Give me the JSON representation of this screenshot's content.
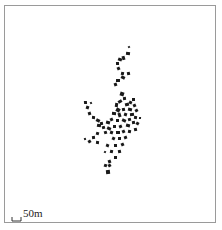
{
  "map": {
    "type": "building footprint map",
    "frame_color": "#9a9a9a",
    "building_color": "#1a1a1a",
    "background_color": "#ffffff"
  },
  "scale_bar": {
    "label": "50m"
  },
  "buildings": [
    [
      128,
      46,
      2,
      2
    ],
    [
      126,
      52,
      4,
      3
    ],
    [
      122,
      56,
      3,
      4
    ],
    [
      118,
      58,
      4,
      3
    ],
    [
      116,
      62,
      3,
      3
    ],
    [
      117,
      67,
      3,
      3
    ],
    [
      121,
      72,
      3,
      3
    ],
    [
      127,
      72,
      3,
      3
    ],
    [
      121,
      76,
      4,
      3
    ],
    [
      116,
      79,
      4,
      3
    ],
    [
      114,
      83,
      3,
      3
    ],
    [
      120,
      92,
      4,
      4
    ],
    [
      123,
      97,
      3,
      3
    ],
    [
      118,
      100,
      4,
      3
    ],
    [
      115,
      103,
      3,
      4
    ],
    [
      125,
      103,
      4,
      3
    ],
    [
      129,
      101,
      3,
      3
    ],
    [
      132,
      98,
      3,
      3
    ],
    [
      133,
      104,
      3,
      3
    ],
    [
      128,
      108,
      4,
      3
    ],
    [
      122,
      108,
      3,
      3
    ],
    [
      116,
      108,
      4,
      4
    ],
    [
      112,
      112,
      4,
      3
    ],
    [
      118,
      113,
      3,
      4
    ],
    [
      124,
      113,
      3,
      3
    ],
    [
      130,
      113,
      4,
      3
    ],
    [
      135,
      109,
      3,
      3
    ],
    [
      134,
      116,
      3,
      3
    ],
    [
      128,
      118,
      3,
      3
    ],
    [
      122,
      119,
      4,
      3
    ],
    [
      116,
      119,
      3,
      3
    ],
    [
      110,
      118,
      3,
      3
    ],
    [
      106,
      121,
      4,
      3
    ],
    [
      100,
      122,
      3,
      3
    ],
    [
      96,
      119,
      4,
      3
    ],
    [
      92,
      116,
      3,
      3
    ],
    [
      88,
      112,
      3,
      3
    ],
    [
      86,
      106,
      3,
      3
    ],
    [
      84,
      101,
      3,
      3
    ],
    [
      90,
      102,
      2,
      2
    ],
    [
      97,
      124,
      4,
      3
    ],
    [
      102,
      126,
      3,
      3
    ],
    [
      107,
      127,
      4,
      3
    ],
    [
      113,
      125,
      3,
      3
    ],
    [
      119,
      125,
      3,
      3
    ],
    [
      126,
      124,
      4,
      3
    ],
    [
      132,
      121,
      3,
      3
    ],
    [
      136,
      122,
      3,
      3
    ],
    [
      139,
      117,
      2,
      2
    ],
    [
      104,
      131,
      3,
      3
    ],
    [
      110,
      131,
      3,
      3
    ],
    [
      116,
      131,
      4,
      3
    ],
    [
      122,
      130,
      3,
      3
    ],
    [
      128,
      130,
      3,
      3
    ],
    [
      134,
      128,
      3,
      3
    ],
    [
      112,
      137,
      3,
      3
    ],
    [
      118,
      137,
      3,
      3
    ],
    [
      124,
      136,
      3,
      3
    ],
    [
      96,
      132,
      3,
      3
    ],
    [
      92,
      136,
      3,
      3
    ],
    [
      88,
      140,
      3,
      3
    ],
    [
      96,
      141,
      3,
      3
    ],
    [
      84,
      138,
      2,
      2
    ],
    [
      106,
      144,
      3,
      3
    ],
    [
      114,
      144,
      3,
      3
    ],
    [
      121,
      143,
      3,
      3
    ],
    [
      110,
      150,
      3,
      3
    ],
    [
      118,
      150,
      3,
      3
    ],
    [
      104,
      151,
      2,
      2
    ],
    [
      114,
      156,
      3,
      3
    ],
    [
      108,
      160,
      3,
      3
    ],
    [
      104,
      164,
      3,
      3
    ],
    [
      106,
      170,
      4,
      4
    ],
    [
      108,
      164,
      3,
      3
    ]
  ]
}
